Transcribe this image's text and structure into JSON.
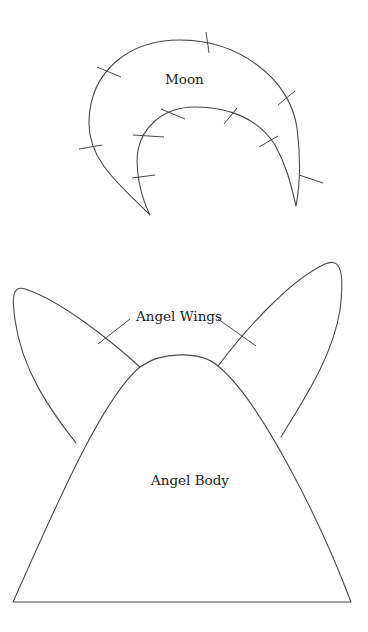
{
  "diagram": {
    "type": "pattern-template",
    "background_color": "#ffffff",
    "line_color": "#4a4a4a",
    "pieces": [
      {
        "id": "moon",
        "label": "Moon",
        "shape": "crescent",
        "notch_marks": 12
      },
      {
        "id": "angel-wings",
        "label": "Angel Wings",
        "shape": "two teardrop wings behind body",
        "leader_lines": 2
      },
      {
        "id": "angel-body",
        "label": "Angel Body",
        "shape": "rounded cone / bell"
      }
    ]
  },
  "labels": {
    "moon": "Moon",
    "wings": "Angel Wings",
    "body": "Angel Body"
  }
}
